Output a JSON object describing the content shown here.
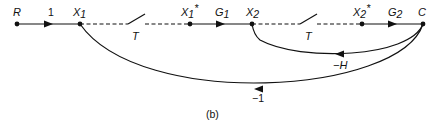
{
  "diagram": {
    "type": "signal-flow-graph",
    "caption": "(b)",
    "nodes": [
      {
        "id": "R",
        "label": "R",
        "x": 17,
        "y": 24
      },
      {
        "id": "X1",
        "label": "X",
        "sub": "1",
        "x": 80,
        "y": 24
      },
      {
        "id": "X1s",
        "label": "X",
        "sub": "1",
        "sup": "*",
        "x": 190,
        "y": 24
      },
      {
        "id": "X2",
        "label": "X",
        "sub": "2",
        "x": 252,
        "y": 24
      },
      {
        "id": "X2s",
        "label": "X",
        "sub": "2",
        "sup": "*",
        "x": 362,
        "y": 24
      },
      {
        "id": "C",
        "label": "C",
        "x": 423,
        "y": 24
      }
    ],
    "branches": [
      {
        "from": "R",
        "to": "X1",
        "gain": "1"
      },
      {
        "from": "X1",
        "to": "X1s",
        "gain": "T",
        "kind": "sampler-switch"
      },
      {
        "from": "X1s",
        "to": "X2",
        "gain": "G",
        "gain_sub": "1"
      },
      {
        "from": "X2",
        "to": "X2s",
        "gain": "T",
        "kind": "sampler-switch"
      },
      {
        "from": "X2s",
        "to": "C",
        "gain": "G",
        "gain_sub": "2"
      },
      {
        "from": "C",
        "to": "X2",
        "gain": "−H",
        "kind": "feedback"
      },
      {
        "from": "C",
        "to": "X1",
        "gain": "−1",
        "kind": "feedback"
      }
    ]
  }
}
